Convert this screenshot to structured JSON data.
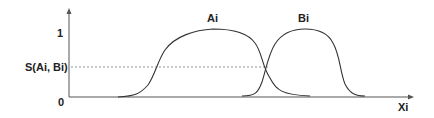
{
  "diagram": {
    "y_axis": {
      "tick_1": "1",
      "tick_0": "0",
      "similarity_label": "S(Ai, Bi)"
    },
    "x_axis": {
      "label": "Xi"
    },
    "curves": [
      {
        "name": "Ai",
        "label": "Ai",
        "color": "#333333"
      },
      {
        "name": "Bi",
        "label": "Bi",
        "color": "#333333"
      }
    ],
    "colors": {
      "axis": "#555555",
      "dashed": "#777777",
      "text": "#222222"
    }
  }
}
